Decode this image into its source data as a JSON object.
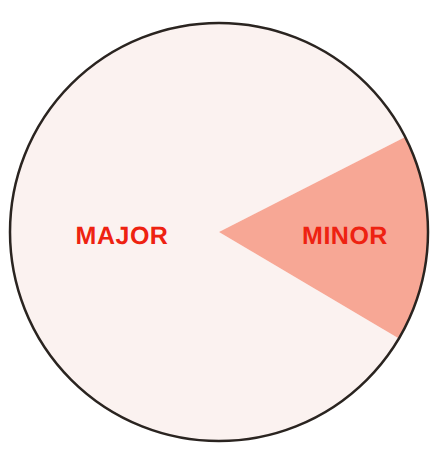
{
  "chart_data": {
    "type": "pie",
    "title": "",
    "subtitle": "",
    "xlabel": "",
    "ylabel": "",
    "legend_position": "none",
    "grid": false,
    "labels_on_slices": true,
    "start_angle_deg": -27,
    "direction": "clockwise",
    "categories": [
      "MAJOR",
      "MINOR"
    ],
    "values": [
      84,
      16
    ],
    "slices": [
      {
        "label": "MAJOR",
        "value": 84,
        "percent": 84,
        "angle_deg": 302,
        "color": "#fbf2f0",
        "label_color": "#ee2211"
      },
      {
        "label": "MINOR",
        "value": 16,
        "percent": 16,
        "angle_deg": 58,
        "color": "#f7a795",
        "label_color": "#ee2211"
      }
    ]
  },
  "figure": {
    "background_color": "#ffffff",
    "outline_color": "#2a2420",
    "outline_width": 2.5,
    "center_x": 219,
    "center_y": 232,
    "radius": 209
  },
  "labels": {
    "major": "MAJOR",
    "minor": "MINOR"
  },
  "colors": {
    "major_fill": "#fbf2f0",
    "minor_fill": "#f7a795",
    "label_red": "#ee2211",
    "outline": "#2a2420",
    "page_background": "#ffffff"
  }
}
